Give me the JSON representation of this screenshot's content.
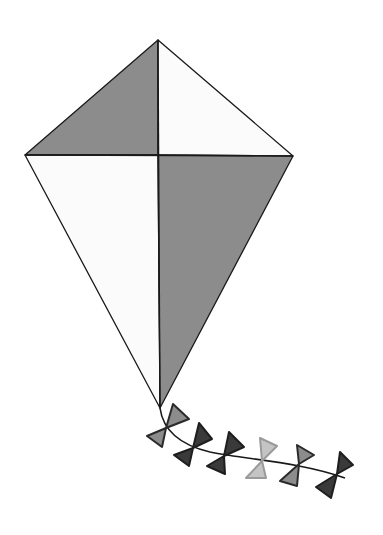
{
  "image": {
    "subject": "kite",
    "width": 383,
    "height": 535,
    "background": "#ffffff"
  },
  "colors": {
    "outline": "#1a1a1a",
    "gray": "#8c8c8c",
    "white": "#fbfbfb",
    "dark": "#3a3a3a",
    "light": "#c4c4c4"
  },
  "kite": {
    "top": [
      158,
      40
    ],
    "left": [
      25,
      155
    ],
    "right": [
      293,
      156
    ],
    "bottom": [
      160,
      408
    ],
    "center": [
      158,
      155
    ],
    "panels": [
      {
        "name": "top-left",
        "fill": "gray"
      },
      {
        "name": "top-right",
        "fill": "white"
      },
      {
        "name": "bottom-left",
        "fill": "white"
      },
      {
        "name": "bottom-right",
        "fill": "gray"
      }
    ]
  },
  "tail": {
    "string_path": "M160,408 C163,430 180,445 210,452 C250,460 300,462 345,478",
    "bows": [
      {
        "fill": "gray",
        "upper": "173,404 189,419 166,428",
        "lower": "166,428 147,436 162,447"
      },
      {
        "fill": "dark",
        "upper": "199,423 212,439 193,448",
        "lower": "193,448 174,455 189,466"
      },
      {
        "fill": "dark",
        "upper": "229,432 244,447 224,456",
        "lower": "224,456 207,466 225,474"
      },
      {
        "fill": "light",
        "upper": "260,438 277,446 262,461",
        "lower": "262,461 246,478 266,478"
      },
      {
        "fill": "gray",
        "upper": "297,445 314,455 299,464",
        "lower": "299,464 280,481 297,486"
      },
      {
        "fill": "dark",
        "upper": "340,452 353,465 337,474",
        "lower": "337,474 316,487 331,498"
      }
    ]
  }
}
